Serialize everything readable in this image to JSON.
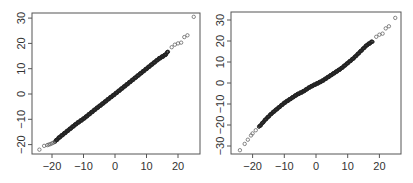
{
  "chart_data": [
    {
      "type": "scatter",
      "subtype": "qq-plot",
      "title": "",
      "xlabel": "",
      "ylabel": "",
      "xlim": [
        -25,
        26
      ],
      "ylim": [
        -23,
        32
      ],
      "grid": false,
      "legend": null,
      "x_ticks": [
        -20,
        -10,
        0,
        10,
        20
      ],
      "y_ticks": [
        -20,
        -10,
        0,
        10,
        20,
        30
      ],
      "x_tick_labels": [
        "−20",
        "−10",
        "0",
        "10",
        "20"
      ],
      "y_tick_labels": [
        "−20",
        "−10",
        "0",
        "10",
        "20",
        "30"
      ],
      "description": "Nearly straight diagonal line of dense points with sparse open-circle outliers at both tails",
      "series": [
        {
          "name": "sample quantiles",
          "x": [
            -24,
            -22.5,
            -21.5,
            -21,
            -20.5,
            -20,
            -19.5,
            -19,
            -18,
            -16,
            -14,
            -12,
            -10,
            -8,
            -6,
            -4,
            -2,
            0,
            2,
            4,
            6,
            8,
            10,
            12,
            14,
            16,
            17,
            18,
            19,
            20,
            21,
            22,
            23,
            25
          ],
          "y": [
            -22,
            -20.5,
            -20.2,
            -20,
            -19.8,
            -19.5,
            -19.2,
            -18.8,
            -17.5,
            -15.5,
            -13.5,
            -11.5,
            -9.8,
            -7.8,
            -5.8,
            -3.9,
            -1.9,
            0,
            2,
            4,
            6,
            8,
            10,
            12,
            14,
            15.5,
            17,
            18.5,
            19.5,
            20,
            20.3,
            22.5,
            23.2,
            30.5
          ]
        }
      ]
    },
    {
      "type": "scatter",
      "subtype": "qq-plot",
      "title": "",
      "xlabel": "",
      "ylabel": "",
      "xlim": [
        -25,
        26
      ],
      "ylim": [
        -34,
        34
      ],
      "grid": false,
      "legend": null,
      "x_ticks": [
        -20,
        -10,
        0,
        10,
        20
      ],
      "y_ticks": [
        -30,
        -20,
        -10,
        0,
        10,
        20,
        30
      ],
      "x_tick_labels": [
        "−20",
        "−10",
        "0",
        "10",
        "20"
      ],
      "y_tick_labels": [
        "−30",
        "−20",
        "−10",
        "0",
        "10",
        "20",
        "30"
      ],
      "description": "S-shaped diagonal (heavier tails) of dense points with sparse open-circle outliers at both ends",
      "series": [
        {
          "name": "sample quantiles",
          "x": [
            -24,
            -22.5,
            -21.5,
            -20.5,
            -20,
            -19,
            -18,
            -16,
            -14,
            -12,
            -10,
            -8,
            -6,
            -4,
            -2,
            0,
            2,
            4,
            6,
            8,
            10,
            12,
            14,
            16,
            18,
            19,
            20,
            21,
            22,
            23,
            25
          ],
          "y": [
            -32,
            -29,
            -27,
            -25,
            -24,
            -22.5,
            -21,
            -17.5,
            -14.5,
            -12,
            -9.5,
            -7.5,
            -5.5,
            -4,
            -2,
            -0.5,
            1,
            3,
            5,
            7,
            9.5,
            12,
            15,
            18,
            20,
            22,
            23,
            23.5,
            26,
            27,
            31
          ]
        }
      ]
    }
  ],
  "plots": [
    {
      "name": "left-qq-plot",
      "x_tick_labels": [
        "−20",
        "−10",
        "0",
        "10",
        "20"
      ],
      "y_tick_labels": [
        "−20",
        "−10",
        "0",
        "10",
        "20",
        "30"
      ]
    },
    {
      "name": "right-qq-plot",
      "x_tick_labels": [
        "−20",
        "−10",
        "0",
        "10",
        "20"
      ],
      "y_tick_labels": [
        "−30",
        "−20",
        "−10",
        "0",
        "10",
        "20",
        "30"
      ]
    }
  ],
  "colors": {
    "frame": "#555555",
    "points": "#222222",
    "outlier_stroke": "#555555",
    "text": "#333333"
  }
}
